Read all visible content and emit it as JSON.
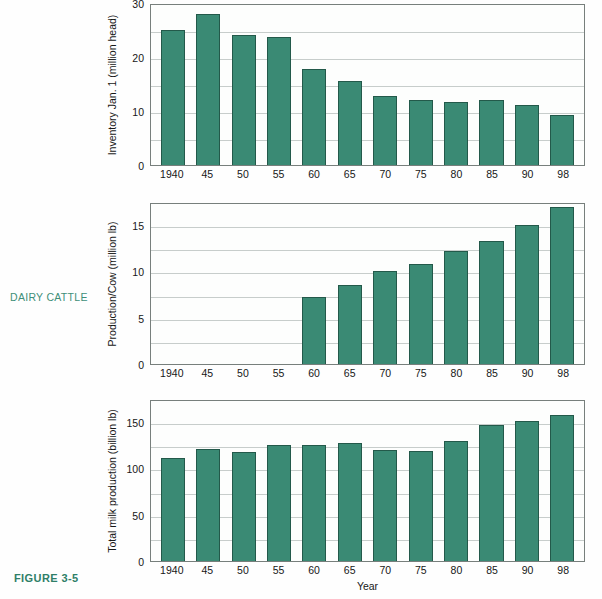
{
  "figure": {
    "side_label": "DAIRY CATTLE",
    "caption": "FIGURE 3-5",
    "accent_color": "#3f8f79",
    "bar_color": "#3a8a74",
    "bar_edge_color": "#23594a",
    "grid_color": "#c7cdcb"
  },
  "chart_data": [
    {
      "type": "bar",
      "title": "",
      "xlabel": "",
      "ylabel": "Inventory Jan. 1 (million head)",
      "categories": [
        "1940",
        "45",
        "50",
        "55",
        "60",
        "65",
        "70",
        "75",
        "80",
        "85",
        "90",
        "98"
      ],
      "values": [
        25.0,
        28.0,
        24.1,
        23.7,
        17.7,
        15.5,
        12.7,
        12.1,
        11.6,
        12.0,
        11.1,
        9.3
      ],
      "ylim": [
        0,
        30
      ],
      "yticks": [
        0,
        10,
        20,
        30
      ],
      "yticklabels": [
        "0",
        "10",
        "20",
        "30"
      ],
      "gridlines": [
        5,
        10,
        15,
        20,
        25,
        30
      ],
      "grid": true,
      "legend": "none"
    },
    {
      "type": "bar",
      "title": "",
      "xlabel": "",
      "ylabel": "Production/Cow (million lb)",
      "categories": [
        "1940",
        "45",
        "50",
        "55",
        "60",
        "65",
        "70",
        "75",
        "80",
        "85",
        "90",
        "98"
      ],
      "values": [
        null,
        null,
        null,
        null,
        7.2,
        8.5,
        10.0,
        10.8,
        12.2,
        13.3,
        15.0,
        17.0
      ],
      "ylim": [
        0,
        17.5
      ],
      "yticks": [
        0,
        5,
        10,
        15
      ],
      "yticklabels": [
        "0",
        "5",
        "10",
        "15"
      ],
      "gridlines": [
        2.5,
        5,
        7.5,
        10,
        12.5,
        15,
        17.5
      ],
      "grid": true,
      "legend": "none"
    },
    {
      "type": "bar",
      "title": "",
      "xlabel": "Year",
      "ylabel": "Total milk production (billion lb)",
      "categories": [
        "1940",
        "45",
        "50",
        "55",
        "60",
        "65",
        "70",
        "75",
        "80",
        "85",
        "90",
        "98"
      ],
      "values": [
        111,
        121,
        118,
        125,
        125,
        127,
        120,
        119,
        130,
        147,
        151,
        158
      ],
      "ylim": [
        0,
        175
      ],
      "yticks": [
        0,
        50,
        100,
        150
      ],
      "yticklabels": [
        "0",
        "50",
        "100",
        "150"
      ],
      "gridlines": [
        25,
        50,
        75,
        100,
        125,
        150,
        175
      ],
      "grid": true,
      "legend": "none"
    }
  ]
}
